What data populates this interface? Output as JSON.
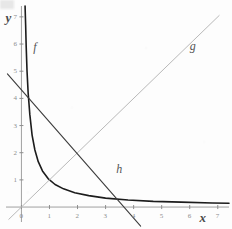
{
  "chart_data": {
    "type": "line",
    "title": "",
    "xlabel": "x",
    "ylabel": "y",
    "xlim": [
      -0.55,
      7.4
    ],
    "ylim": [
      -0.55,
      7.4
    ],
    "grid": false,
    "legend_position": "inline-labels",
    "x_ticks": [
      0,
      1,
      2,
      3,
      4,
      5,
      6,
      7
    ],
    "x_tick_labels": [
      "0",
      "1",
      "2",
      "3",
      "4",
      "5",
      "6",
      "7"
    ],
    "y_ticks": [
      0,
      1,
      2,
      3,
      4,
      5,
      6,
      7
    ],
    "y_tick_labels": [
      "0",
      "1",
      "2",
      "3",
      "4",
      "5",
      "6",
      "7"
    ],
    "series": [
      {
        "name": "f",
        "label": "f",
        "kind": "hyperbola",
        "color": "#1c1c1c",
        "description": "f(x) = 1/x style decreasing curve with vertical asymptote at x = 0 and horizontal asymptote at y = 0",
        "label_position": {
          "x": 0.42,
          "y": 5.85
        },
        "points": [
          {
            "x": 0.13,
            "y": 7.4
          },
          {
            "x": 0.15,
            "y": 6.7
          },
          {
            "x": 0.17,
            "y": 5.9
          },
          {
            "x": 0.2,
            "y": 5.0
          },
          {
            "x": 0.24,
            "y": 4.2
          },
          {
            "x": 0.3,
            "y": 3.4
          },
          {
            "x": 0.38,
            "y": 2.65
          },
          {
            "x": 0.48,
            "y": 2.1
          },
          {
            "x": 0.6,
            "y": 1.67
          },
          {
            "x": 0.75,
            "y": 1.33
          },
          {
            "x": 0.95,
            "y": 1.05
          },
          {
            "x": 1.2,
            "y": 0.83
          },
          {
            "x": 1.5,
            "y": 0.67
          },
          {
            "x": 1.9,
            "y": 0.53
          },
          {
            "x": 2.4,
            "y": 0.42
          },
          {
            "x": 3.0,
            "y": 0.33
          },
          {
            "x": 3.8,
            "y": 0.26
          },
          {
            "x": 4.7,
            "y": 0.21
          },
          {
            "x": 5.7,
            "y": 0.18
          },
          {
            "x": 6.8,
            "y": 0.15
          },
          {
            "x": 7.4,
            "y": 0.14
          }
        ]
      },
      {
        "name": "g",
        "label": "g",
        "kind": "line",
        "color": "#b9b9b9",
        "description": "g(x) = x, identity line through the origin with slope 1",
        "label_position": {
          "x": 6.0,
          "y": 5.9
        },
        "endpoints": [
          {
            "x": -0.45,
            "y": -0.45
          },
          {
            "x": 7.05,
            "y": 7.05
          }
        ]
      },
      {
        "name": "h",
        "label": "h",
        "kind": "line",
        "color": "#3d3d3d",
        "description": "h(x) decreasing line, y-intercept near 4.3, x-intercept near 3.6, slope about -1.2",
        "label_position": {
          "x": 3.38,
          "y": 1.38
        },
        "endpoints": [
          {
            "x": -0.5,
            "y": 4.9
          },
          {
            "x": 4.25,
            "y": -0.7
          }
        ]
      }
    ],
    "axis_color": "#a0a0a0",
    "tick_color": "#8d8d8d"
  },
  "axes": {
    "y_axis_label": "y",
    "x_axis_label": "x"
  },
  "labels": {
    "f": "f",
    "g": "g",
    "h": "h"
  }
}
